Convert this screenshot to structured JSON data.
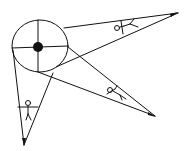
{
  "diagram": {
    "colors": {
      "ink": "#111111",
      "background": "#ffffff"
    },
    "hub": {
      "shape": "circle",
      "center": [
        38,
        46
      ],
      "rx": 28,
      "ry": 26,
      "quadrants": 4,
      "center_dot_radius": 5
    },
    "wedges": [
      {
        "id": "upper-right",
        "tip": [
          178,
          13
        ],
        "base": [
          [
            63,
            27
          ],
          [
            55,
            68
          ]
        ],
        "figure": "stick-figure"
      },
      {
        "id": "lower-right",
        "tip": [
          155,
          117
        ],
        "base": [
          [
            69,
            48
          ],
          [
            38,
            72
          ]
        ],
        "figure": "stick-figure"
      },
      {
        "id": "bottom",
        "tip": [
          24,
          145
        ],
        "base": [
          [
            12,
            50
          ],
          [
            52,
            74
          ]
        ],
        "figure": "stick-figure"
      }
    ],
    "figure_count": 3
  }
}
